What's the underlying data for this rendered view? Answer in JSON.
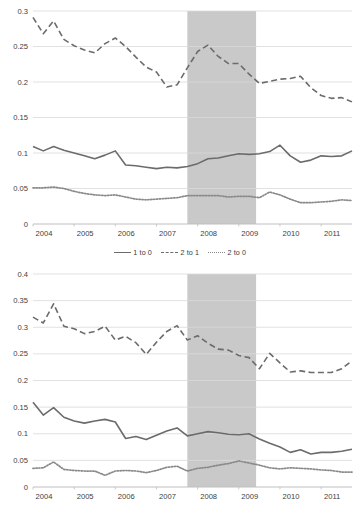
{
  "figure": {
    "background_color": "#ffffff",
    "recession_band_color": "#c9c9c9",
    "gridline_color": "#d9d9d9",
    "axis_color": "#bfbfbf",
    "text_color": "#404040"
  },
  "chart_data": [
    {
      "type": "line",
      "title": "",
      "subtitle": "",
      "xlabel": "",
      "ylabel": "",
      "grid": "horizontal",
      "legend_position": "bottom",
      "xlim": [
        2004,
        2011.75
      ],
      "ylim": [
        0,
        0.3
      ],
      "xticks": [
        "2004",
        "2005",
        "2006",
        "2007",
        "2008",
        "2009",
        "2010",
        "2011"
      ],
      "xtick_values": [
        2004,
        2005,
        2006,
        2007,
        2008,
        2009,
        2010,
        2011
      ],
      "yticks": [
        "0",
        "0.05",
        "0.1",
        "0.15",
        "0.2",
        "0.25",
        "0.3"
      ],
      "ytick_values": [
        0,
        0.05,
        0.1,
        0.15,
        0.2,
        0.25,
        0.3
      ],
      "annotations": [
        {
          "type": "shaded-band",
          "label": "recession",
          "x_start": 2007.75,
          "x_end": 2009.42,
          "color": "#c9c9c9"
        }
      ],
      "x": [
        2004.0,
        2004.25,
        2004.5,
        2004.75,
        2005.0,
        2005.25,
        2005.5,
        2005.75,
        2006.0,
        2006.25,
        2006.5,
        2006.75,
        2007.0,
        2007.25,
        2007.5,
        2007.75,
        2008.0,
        2008.25,
        2008.5,
        2008.75,
        2009.0,
        2009.25,
        2009.5,
        2009.75,
        2010.0,
        2010.25,
        2010.5,
        2010.75,
        2011.0,
        2011.25,
        2011.5,
        2011.75
      ],
      "series": [
        {
          "name": "1 to 0",
          "style": "solid",
          "color": "#6b6b6b",
          "values": [
            0.109,
            0.103,
            0.109,
            0.104,
            0.1,
            0.096,
            0.092,
            0.097,
            0.103,
            0.083,
            0.082,
            0.08,
            0.078,
            0.08,
            0.079,
            0.081,
            0.085,
            0.092,
            0.093,
            0.096,
            0.099,
            0.098,
            0.099,
            0.102,
            0.111,
            0.096,
            0.087,
            0.09,
            0.096,
            0.095,
            0.096,
            0.103
          ]
        },
        {
          "name": "2 to 1",
          "style": "dashed",
          "color": "#6b6b6b",
          "values": [
            0.291,
            0.268,
            0.286,
            0.26,
            0.251,
            0.245,
            0.241,
            0.254,
            0.262,
            0.25,
            0.235,
            0.221,
            0.214,
            0.193,
            0.196,
            0.22,
            0.243,
            0.252,
            0.236,
            0.226,
            0.226,
            0.211,
            0.198,
            0.201,
            0.204,
            0.205,
            0.208,
            0.192,
            0.181,
            0.177,
            0.178,
            0.172
          ]
        },
        {
          "name": "2 to 0",
          "style": "dotted",
          "color": "#8a8a8a",
          "values": [
            0.051,
            0.051,
            0.052,
            0.05,
            0.046,
            0.043,
            0.041,
            0.04,
            0.041,
            0.038,
            0.035,
            0.034,
            0.035,
            0.036,
            0.037,
            0.04,
            0.04,
            0.04,
            0.04,
            0.038,
            0.039,
            0.039,
            0.037,
            0.045,
            0.041,
            0.035,
            0.03,
            0.03,
            0.031,
            0.032,
            0.034,
            0.033
          ]
        }
      ],
      "legend": [
        {
          "label": "1 to 0",
          "style": "solid"
        },
        {
          "label": "2 to 1",
          "style": "dashed"
        },
        {
          "label": "2 to 0",
          "style": "dotted"
        }
      ]
    },
    {
      "type": "line",
      "title": "",
      "subtitle": "",
      "xlabel": "",
      "ylabel": "",
      "grid": "horizontal",
      "legend_position": "bottom",
      "xlim": [
        2004,
        2011.75
      ],
      "ylim": [
        0,
        0.4
      ],
      "xticks": [
        "2004",
        "2005",
        "2006",
        "2007",
        "2008",
        "2009",
        "2010",
        "2011"
      ],
      "xtick_values": [
        2004,
        2005,
        2006,
        2007,
        2008,
        2009,
        2010,
        2011
      ],
      "yticks": [
        "0",
        "0.05",
        "0.1",
        "0.15",
        "0.2",
        "0.25",
        "0.3",
        "0.35",
        "0.4"
      ],
      "ytick_values": [
        0,
        0.05,
        0.1,
        0.15,
        0.2,
        0.25,
        0.3,
        0.35,
        0.4
      ],
      "annotations": [
        {
          "type": "shaded-band",
          "label": "recession",
          "x_start": 2007.75,
          "x_end": 2009.42,
          "color": "#c9c9c9"
        }
      ],
      "x": [
        2004.0,
        2004.25,
        2004.5,
        2004.75,
        2005.0,
        2005.25,
        2005.5,
        2005.75,
        2006.0,
        2006.25,
        2006.5,
        2006.75,
        2007.0,
        2007.25,
        2007.5,
        2007.75,
        2008.0,
        2008.25,
        2008.5,
        2008.75,
        2009.0,
        2009.25,
        2009.5,
        2009.75,
        2010.0,
        2010.25,
        2010.5,
        2010.75,
        2011.0,
        2011.25,
        2011.5,
        2011.75
      ],
      "series": [
        {
          "name": "3+ to 1",
          "style": "solid",
          "color": "#6b6b6b",
          "values": [
            0.159,
            0.135,
            0.149,
            0.131,
            0.124,
            0.12,
            0.124,
            0.127,
            0.122,
            0.091,
            0.095,
            0.089,
            0.097,
            0.105,
            0.111,
            0.096,
            0.1,
            0.104,
            0.102,
            0.099,
            0.098,
            0.1,
            0.09,
            0.082,
            0.075,
            0.065,
            0.07,
            0.062,
            0.065,
            0.065,
            0.067,
            0.071
          ]
        },
        {
          "name": "3+ to 2",
          "style": "dashed",
          "color": "#6b6b6b",
          "values": [
            0.319,
            0.308,
            0.344,
            0.302,
            0.297,
            0.288,
            0.292,
            0.302,
            0.276,
            0.283,
            0.271,
            0.249,
            0.272,
            0.292,
            0.303,
            0.276,
            0.284,
            0.27,
            0.259,
            0.257,
            0.247,
            0.243,
            0.222,
            0.251,
            0.233,
            0.216,
            0.218,
            0.215,
            0.215,
            0.215,
            0.222,
            0.237
          ]
        },
        {
          "name": "3+ to 0",
          "style": "dotted",
          "color": "#8a8a8a",
          "values": [
            0.035,
            0.036,
            0.047,
            0.033,
            0.031,
            0.03,
            0.03,
            0.022,
            0.03,
            0.031,
            0.03,
            0.027,
            0.031,
            0.037,
            0.039,
            0.03,
            0.035,
            0.037,
            0.041,
            0.044,
            0.049,
            0.045,
            0.041,
            0.036,
            0.034,
            0.036,
            0.035,
            0.034,
            0.032,
            0.031,
            0.028,
            0.028
          ]
        }
      ],
      "legend": [
        {
          "label": "3+ to 1",
          "style": "solid"
        },
        {
          "label": "3+ to 2",
          "style": "dashed"
        },
        {
          "label": "3+ to 0",
          "style": "dotted"
        }
      ]
    }
  ]
}
